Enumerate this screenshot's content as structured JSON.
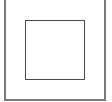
{
  "control": {
    "icon": "square-stop-icon",
    "colors": {
      "background": "#ffffff",
      "frame_border": "#7a7a7a",
      "inner_border": "#4a4a4a"
    }
  }
}
